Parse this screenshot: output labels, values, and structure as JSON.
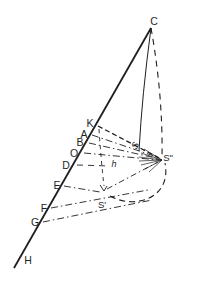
{
  "diagram": {
    "background": "#ffffff",
    "stroke_color": "#1f1f1f",
    "label_color": "#1f1f1f",
    "labels": [
      {
        "id": "C",
        "text": "C",
        "x": 154,
        "y": 25,
        "size": 10.5
      },
      {
        "id": "K",
        "text": "K",
        "x": 90,
        "y": 127,
        "size": 10.5
      },
      {
        "id": "A",
        "text": "A",
        "x": 84,
        "y": 138,
        "size": 10.5
      },
      {
        "id": "B",
        "text": "B",
        "x": 80,
        "y": 146,
        "size": 10.5
      },
      {
        "id": "O",
        "text": "O",
        "x": 74,
        "y": 157,
        "size": 10.5
      },
      {
        "id": "D",
        "text": "D",
        "x": 66,
        "y": 169,
        "size": 10.5
      },
      {
        "id": "E",
        "text": "E",
        "x": 57,
        "y": 189,
        "size": 10.5
      },
      {
        "id": "F",
        "text": "F",
        "x": 44,
        "y": 212,
        "size": 10.5
      },
      {
        "id": "G",
        "text": "G",
        "x": 35,
        "y": 226,
        "size": 10.5
      },
      {
        "id": "H",
        "text": "H",
        "x": 28,
        "y": 264,
        "size": 10.5
      },
      {
        "id": "S",
        "text": "S",
        "x": 138,
        "y": 147,
        "size": 9.5,
        "rotate": -62,
        "italic": true
      },
      {
        "id": "S2",
        "text": "S\"",
        "x": 168,
        "y": 161,
        "size": 9.5
      },
      {
        "id": "S1",
        "text": "S'",
        "x": 102,
        "y": 208,
        "size": 9.5
      },
      {
        "id": "h",
        "text": "h",
        "x": 114,
        "y": 167,
        "size": 9,
        "italic": true
      }
    ],
    "lines": [
      {
        "name": "main-axis-line",
        "d": "M14,268 L151,28",
        "width": 1.8,
        "dash": ""
      },
      {
        "name": "c-to-s-solid-line",
        "d": "M151,28 Q142,95 139,151",
        "width": 1.0,
        "dash": ""
      },
      {
        "name": "c-to-s2-dashed-line",
        "d": "M151,28 Q163,95 162,157",
        "width": 1.1,
        "dash": "6,5"
      },
      {
        "name": "k-to-s2-bold-dash",
        "d": "M98,126 L161,159",
        "width": 1.3,
        "dash": "5,3"
      },
      {
        "name": "a-to-s2-dashdot",
        "d": "M92,135 L160,158",
        "width": 0.9,
        "dash": "7,3,1.5,3"
      },
      {
        "name": "b-to-s2-dashdot",
        "d": "M89,143 L160,159",
        "width": 0.9,
        "dash": "7,3,1.5,3"
      },
      {
        "name": "o-to-s2-dashdot",
        "d": "M84,153 L159,160",
        "width": 0.9,
        "dash": "7,3,1.5,3"
      },
      {
        "name": "d-dashed-segment",
        "d": "M77,165 L110,166",
        "width": 0.9,
        "dash": "6,5"
      },
      {
        "name": "k-to-s1-dashed-drop",
        "d": "M99,129 Q101,160 104,186",
        "width": 0.9,
        "dash": "4,4"
      },
      {
        "name": "s1-arrowhead",
        "d": "M100,185 L104,191 L107,186",
        "width": 0.9,
        "dash": ""
      },
      {
        "name": "e-to-s1-dashdot",
        "d": "M64,186 L100,192",
        "width": 0.9,
        "dash": "7,3,1.5,3"
      },
      {
        "name": "f-dashdot-line",
        "d": "M51,208 L148,190",
        "width": 0.9,
        "dash": "7,3,1.5,3"
      },
      {
        "name": "g-dashdot-line",
        "d": "M43,222 L152,200",
        "width": 0.9,
        "dash": "7,3,1.5,3"
      },
      {
        "name": "s1-to-s2-dashdot",
        "d": "M107,189 L158,162",
        "width": 0.9,
        "dash": "6,3,1.5,3"
      },
      {
        "name": "s1-s2-dashed-arc",
        "d": "M110,196 C135,210 172,198 165,163",
        "width": 1.1,
        "dash": "6,4"
      },
      {
        "name": "fan-ray-1",
        "d": "M144,149 L162,160",
        "width": 0.7,
        "dash": ""
      },
      {
        "name": "fan-ray-2",
        "d": "M141,153 L162,160",
        "width": 0.7,
        "dash": ""
      },
      {
        "name": "fan-ray-3",
        "d": "M139,157 L162,160",
        "width": 0.7,
        "dash": ""
      },
      {
        "name": "fan-ray-4",
        "d": "M139,161 L162,160",
        "width": 0.7,
        "dash": ""
      },
      {
        "name": "fan-ray-5",
        "d": "M141,165 L162,160",
        "width": 0.7,
        "dash": ""
      },
      {
        "name": "fan-ray-6",
        "d": "M145,169 L162,160",
        "width": 0.7,
        "dash": ""
      },
      {
        "name": "fan-ray-7",
        "d": "M149,172 L162,160",
        "width": 0.7,
        "dash": ""
      }
    ]
  }
}
